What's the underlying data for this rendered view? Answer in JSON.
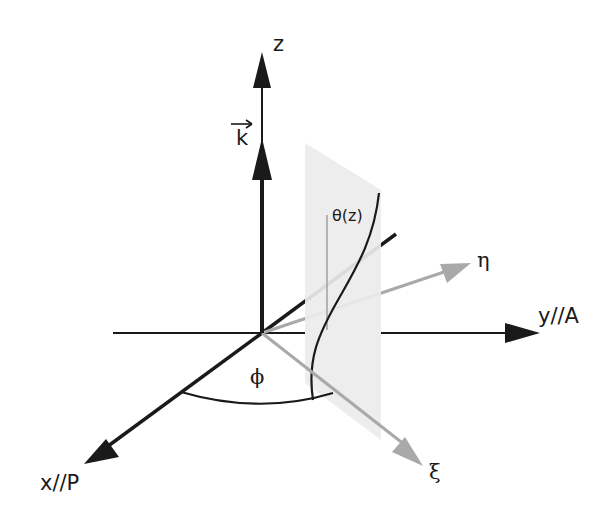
{
  "diagram": {
    "type": "3d-coordinate-diagram",
    "colors": {
      "axis": "#1a1a1a",
      "rotated_axis": "#a9a9a9",
      "plane_fill": "#ececec",
      "reference_line": "#b3b3b3"
    },
    "labels": {
      "z_axis": "z",
      "wave_vector": "k",
      "theta": "θ(z)",
      "eta_axis": "η",
      "y_axis": "y//A",
      "x_axis": "x//P",
      "xi_axis": "ξ",
      "phi_angle": "ϕ"
    },
    "nodes": [
      {
        "id": "z",
        "label": "z"
      },
      {
        "id": "k",
        "label": "k (vector)"
      },
      {
        "id": "x",
        "label": "x//P"
      },
      {
        "id": "y",
        "label": "y//A"
      },
      {
        "id": "xi",
        "label": "ξ"
      },
      {
        "id": "eta",
        "label": "η"
      },
      {
        "id": "plane",
        "label": "θ(z) plane"
      }
    ],
    "edges": [
      {
        "from": "origin",
        "to": "z",
        "style": "black arrow"
      },
      {
        "from": "origin",
        "to": "k",
        "style": "thick black arrow"
      },
      {
        "from": "origin",
        "to": "x",
        "style": "black arrow"
      },
      {
        "from": "origin",
        "to": "y",
        "style": "black arrow"
      },
      {
        "from": "origin",
        "to": "xi",
        "style": "gray arrow"
      },
      {
        "from": "origin",
        "to": "eta",
        "style": "gray arrow"
      }
    ]
  }
}
